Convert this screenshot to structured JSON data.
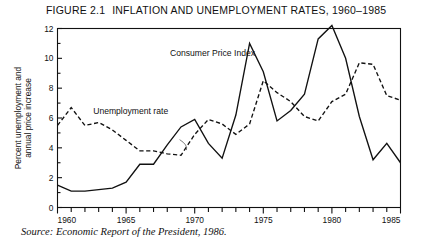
{
  "figure": {
    "number": "FIGURE 2.1",
    "title": "INFLATION AND UNEMPLOYMENT RATES, 1960–1985",
    "source": "Source: Economic Report of the President, 1986."
  },
  "chart_data": {
    "type": "line",
    "title": "INFLATION AND UNEMPLOYMENT RATES, 1960–1985",
    "xlabel": "",
    "ylabel_line1": "Percent unemployment and",
    "ylabel_line2": "annual price increase",
    "xlim": [
      1960,
      1985
    ],
    "ylim": [
      0,
      12
    ],
    "ytick_step": 2,
    "yticks": [
      0,
      2,
      4,
      6,
      8,
      10,
      12
    ],
    "xticks_labeled": [
      1960,
      1965,
      1970,
      1975,
      1980,
      1985
    ],
    "xtick_step_minor": 1,
    "grid": false,
    "legend_position": "inline-annotations",
    "x": [
      1960,
      1961,
      1962,
      1963,
      1964,
      1965,
      1966,
      1967,
      1968,
      1969,
      1970,
      1971,
      1972,
      1973,
      1974,
      1975,
      1976,
      1977,
      1978,
      1979,
      1980,
      1981,
      1982,
      1983,
      1984,
      1985
    ],
    "series": [
      {
        "name": "Consumer Price Index",
        "style": "solid",
        "color": "#111111",
        "label_x": 1968.2,
        "label_y": 10.15,
        "values": [
          1.5,
          1.1,
          1.1,
          1.2,
          1.3,
          1.7,
          2.9,
          2.9,
          4.2,
          5.4,
          5.9,
          4.3,
          3.3,
          6.2,
          11.0,
          9.1,
          5.8,
          6.5,
          7.6,
          11.3,
          12.2,
          10.0,
          6.1,
          3.2,
          4.3,
          3.0
        ],
        "annotations": [
          {
            "year": 1974,
            "value": 11.0,
            "note": "first peak"
          },
          {
            "year": 1980,
            "value": 12.2,
            "note": "highest peak"
          }
        ]
      },
      {
        "name": "Unemployment rate",
        "style": "dashed",
        "color": "#111111",
        "label_x": 1962.6,
        "label_y": 6.25,
        "values": [
          5.5,
          6.7,
          5.5,
          5.7,
          5.2,
          4.5,
          3.8,
          3.8,
          3.6,
          3.5,
          4.9,
          5.9,
          5.6,
          4.9,
          5.6,
          8.5,
          7.7,
          7.1,
          6.1,
          5.8,
          7.1,
          7.6,
          9.7,
          9.6,
          7.5,
          7.2
        ]
      }
    ],
    "pointer_mark": {
      "from_x": 1968.9,
      "from_y": 4.55,
      "to_x": 1969.4,
      "to_y": 3.85
    }
  }
}
